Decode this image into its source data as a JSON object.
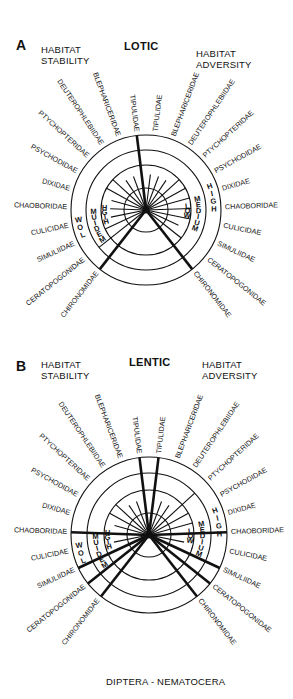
{
  "footer": "DIPTERA - NEMATOCERA",
  "colors": {
    "ink": "#111111",
    "background": "#ffffff"
  },
  "taxa": [
    "TIPULIDAE",
    "BLEPHARICERIDAE",
    "DEUTEROPHLEBIIDAE",
    "PTYCHOPTERIDAE",
    "PSYCHODIDAE",
    "DIXIDAE",
    "CHAOBORIDAE",
    "CULICIDAE",
    "SIMULIIDAE",
    "CERATOPOGONIDAE",
    "CHIRONOMIDAE"
  ],
  "panels": [
    {
      "letter": "A",
      "title": "LOTIC",
      "left_header": [
        "HABITAT",
        "STABILITY"
      ],
      "right_header": [
        "HABITAT",
        "ADVERSITY"
      ],
      "center": [
        146,
        210
      ],
      "rings": [
        22,
        45,
        60,
        75
      ],
      "left_scale": {
        "outer": "LOW",
        "middle": "MEDIUM",
        "inner": "HIGH"
      },
      "right_scale": {
        "outer": "HIGH",
        "middle": "MEDIUM",
        "inner": "LOW"
      },
      "stability_values": [
        4,
        1,
        1,
        2,
        2,
        1,
        1,
        1,
        2,
        3,
        4
      ],
      "adversity_values": [
        1,
        1,
        1,
        2,
        2,
        2,
        2,
        2,
        1,
        2,
        4
      ]
    },
    {
      "letter": "B",
      "title": "LENTIC",
      "left_header": [
        "HABITAT",
        "STABILITY"
      ],
      "right_header": [
        "HABITAT",
        "ADVERSITY"
      ],
      "center": [
        149,
        190
      ],
      "rings": [
        22,
        45,
        62,
        78
      ],
      "left_scale": {
        "outer": "LOW",
        "middle": "MEDIUM",
        "inner": "HIGH"
      },
      "right_scale": {
        "outer": "HIGH",
        "middle": "MEDIUM",
        "inner": "LOW"
      },
      "stability_values": [
        4,
        1,
        1,
        2,
        2,
        1,
        4,
        1,
        4,
        4,
        4
      ],
      "adversity_values": [
        4,
        1,
        1,
        3,
        2,
        2,
        4,
        1,
        4,
        4,
        4
      ]
    }
  ]
}
